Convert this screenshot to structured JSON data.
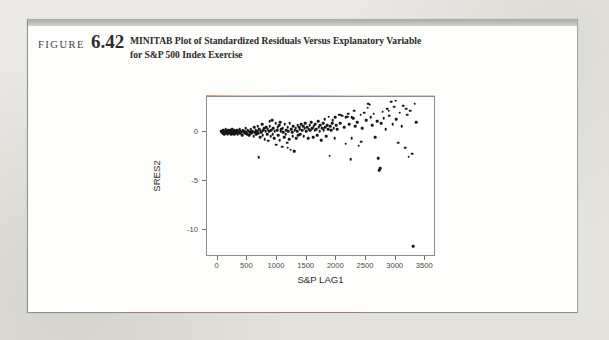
{
  "figure": {
    "label_word": "FIGURE",
    "number": "6.42",
    "caption_line1": "MINITAB Plot of Standardized Residuals Versus Explanatory Variable",
    "caption_line2": "for S&P 500 Index Exercise"
  },
  "colors": {
    "page_background": "#e9e8e4",
    "figure_background": "#fdfdfc",
    "header_bar": "#bdbdb9",
    "point_color": "#17171a",
    "axis_color": "#8c8c8a",
    "text_color": "#2b2a28"
  },
  "chart_data": {
    "type": "scatter",
    "title": "",
    "xlabel": "S&P LAG1",
    "ylabel": "SRES2",
    "xlim": [
      -180,
      3680
    ],
    "ylim": [
      -12.8,
      3.6
    ],
    "grid": false,
    "legend": "none",
    "xticks": [
      0,
      500,
      1000,
      1500,
      2000,
      2500,
      3000,
      3500
    ],
    "xtick_labels": [
      "0",
      "500",
      "1000",
      "1500",
      "2000",
      "2500",
      "3000",
      "3500"
    ],
    "yticks": [
      0,
      -5,
      -10
    ],
    "ytick_labels": [
      "0",
      "-5",
      "-10"
    ],
    "point_count": 232,
    "notable_outlier": {
      "x": 3300,
      "y": -11.7
    },
    "points": [
      [
        60,
        0.1
      ],
      [
        75,
        0.0
      ],
      [
        88,
        -0.1
      ],
      [
        96,
        0.2
      ],
      [
        104,
        0.0
      ],
      [
        112,
        -0.2
      ],
      [
        120,
        0.1
      ],
      [
        128,
        0.0
      ],
      [
        136,
        0.3
      ],
      [
        144,
        -0.1
      ],
      [
        152,
        0.1
      ],
      [
        160,
        0.0
      ],
      [
        168,
        -0.2
      ],
      [
        176,
        0.2
      ],
      [
        184,
        0.0
      ],
      [
        192,
        0.1
      ],
      [
        200,
        -0.1
      ],
      [
        208,
        0.0
      ],
      [
        216,
        0.2
      ],
      [
        224,
        -0.2
      ],
      [
        232,
        0.1
      ],
      [
        240,
        0.0
      ],
      [
        248,
        0.3
      ],
      [
        256,
        -0.1
      ],
      [
        264,
        0.0
      ],
      [
        272,
        0.1
      ],
      [
        280,
        -0.2
      ],
      [
        288,
        0.2
      ],
      [
        296,
        0.0
      ],
      [
        304,
        0.1
      ],
      [
        312,
        -0.1
      ],
      [
        320,
        0.0
      ],
      [
        330,
        0.2
      ],
      [
        340,
        -0.2
      ],
      [
        350,
        0.1
      ],
      [
        360,
        0.0
      ],
      [
        370,
        0.3
      ],
      [
        380,
        -0.1
      ],
      [
        390,
        0.1
      ],
      [
        400,
        0.0
      ],
      [
        412,
        -0.3
      ],
      [
        424,
        0.2
      ],
      [
        436,
        0.0
      ],
      [
        448,
        0.1
      ],
      [
        460,
        -0.1
      ],
      [
        472,
        0.4
      ],
      [
        484,
        0.0
      ],
      [
        496,
        -0.2
      ],
      [
        508,
        0.2
      ],
      [
        520,
        0.1
      ],
      [
        532,
        -0.3
      ],
      [
        544,
        0.0
      ],
      [
        556,
        0.3
      ],
      [
        568,
        -0.1
      ],
      [
        580,
        0.1
      ],
      [
        592,
        0.0
      ],
      [
        604,
        -0.4
      ],
      [
        616,
        0.5
      ],
      [
        628,
        0.0
      ],
      [
        640,
        0.2
      ],
      [
        652,
        -0.2
      ],
      [
        664,
        0.1
      ],
      [
        676,
        0.6
      ],
      [
        688,
        -0.1
      ],
      [
        700,
        0.3
      ],
      [
        712,
        -0.5
      ],
      [
        724,
        0.1
      ],
      [
        736,
        0.0
      ],
      [
        748,
        0.8
      ],
      [
        760,
        -0.3
      ],
      [
        772,
        0.2
      ],
      [
        784,
        0.4
      ],
      [
        690,
        -2.6
      ],
      [
        796,
        -0.7
      ],
      [
        808,
        0.1
      ],
      [
        820,
        0.5
      ],
      [
        832,
        -0.2
      ],
      [
        844,
        0.3
      ],
      [
        856,
        -0.9
      ],
      [
        868,
        0.1
      ],
      [
        880,
        0.6
      ],
      [
        892,
        -0.4
      ],
      [
        904,
        0.2
      ],
      [
        916,
        1.2
      ],
      [
        928,
        -0.2
      ],
      [
        940,
        0.4
      ],
      [
        952,
        -0.6
      ],
      [
        964,
        0.1
      ],
      [
        976,
        0.9
      ],
      [
        988,
        -1.3
      ],
      [
        1000,
        0.2
      ],
      [
        1012,
        0.5
      ],
      [
        1024,
        -0.3
      ],
      [
        1036,
        0.7
      ],
      [
        1048,
        -0.8
      ],
      [
        1060,
        0.1
      ],
      [
        1072,
        0.3
      ],
      [
        1084,
        -1.5
      ],
      [
        1096,
        0.4
      ],
      [
        1108,
        0.0
      ],
      [
        1120,
        -0.5
      ],
      [
        1132,
        0.8
      ],
      [
        1144,
        -0.2
      ],
      [
        1156,
        0.2
      ],
      [
        1168,
        -1.1
      ],
      [
        1180,
        0.5
      ],
      [
        1192,
        0.1
      ],
      [
        1204,
        -0.7
      ],
      [
        1216,
        0.9
      ],
      [
        1228,
        -1.8
      ],
      [
        1240,
        0.3
      ],
      [
        1252,
        0.0
      ],
      [
        1264,
        -0.4
      ],
      [
        1276,
        0.6
      ],
      [
        1288,
        -1.9
      ],
      [
        1300,
        0.2
      ],
      [
        1312,
        0.4
      ],
      [
        1324,
        -0.6
      ],
      [
        1336,
        0.1
      ],
      [
        1348,
        0.7
      ],
      [
        1360,
        -0.3
      ],
      [
        1372,
        0.5
      ],
      [
        1384,
        0.3
      ],
      [
        1396,
        -0.2
      ],
      [
        1410,
        0.8
      ],
      [
        1424,
        0.2
      ],
      [
        1438,
        0.6
      ],
      [
        1452,
        -0.4
      ],
      [
        1466,
        0.4
      ],
      [
        1480,
        0.9
      ],
      [
        1494,
        0.1
      ],
      [
        1508,
        0.5
      ],
      [
        1522,
        -0.6
      ],
      [
        1536,
        0.3
      ],
      [
        1550,
        0.7
      ],
      [
        1564,
        0.2
      ],
      [
        1578,
        1.0
      ],
      [
        1592,
        0.4
      ],
      [
        1606,
        -0.5
      ],
      [
        1620,
        0.6
      ],
      [
        1634,
        0.2
      ],
      [
        1648,
        0.8
      ],
      [
        1662,
        0.3
      ],
      [
        1676,
        -0.3
      ],
      [
        1690,
        1.1
      ],
      [
        1704,
        0.5
      ],
      [
        1718,
        0.1
      ],
      [
        1732,
        0.7
      ],
      [
        1746,
        -0.8
      ],
      [
        1760,
        0.4
      ],
      [
        1774,
        0.9
      ],
      [
        1788,
        0.2
      ],
      [
        1802,
        1.3
      ],
      [
        1816,
        0.5
      ],
      [
        1830,
        -0.4
      ],
      [
        1844,
        0.7
      ],
      [
        1858,
        0.3
      ],
      [
        1872,
        1.6
      ],
      [
        1886,
        -2.4
      ],
      [
        1900,
        0.6
      ],
      [
        1914,
        0.2
      ],
      [
        1928,
        0.9
      ],
      [
        1942,
        1.2
      ],
      [
        1956,
        0.4
      ],
      [
        1970,
        -0.6
      ],
      [
        1984,
        1.5
      ],
      [
        1998,
        0.7
      ],
      [
        2012,
        0.3
      ],
      [
        2040,
        1.8
      ],
      [
        2070,
        0.9
      ],
      [
        2100,
        1.7
      ],
      [
        2130,
        0.5
      ],
      [
        2160,
        -1.2
      ],
      [
        2185,
        1.6
      ],
      [
        2200,
        1.9
      ],
      [
        2215,
        0.8
      ],
      [
        2240,
        -2.8
      ],
      [
        2260,
        -0.6
      ],
      [
        2280,
        1.4
      ],
      [
        2300,
        2.2
      ],
      [
        2320,
        0.6
      ],
      [
        2350,
        1.0
      ],
      [
        2380,
        -1.4
      ],
      [
        2410,
        1.8
      ],
      [
        2440,
        0.4
      ],
      [
        2470,
        2.0
      ],
      [
        2500,
        1.2
      ],
      [
        2530,
        2.5
      ],
      [
        2560,
        2.8
      ],
      [
        2580,
        1.5
      ],
      [
        2600,
        0.7
      ],
      [
        2630,
        1.9
      ],
      [
        2660,
        -0.5
      ],
      [
        2690,
        1.1
      ],
      [
        2710,
        -2.7
      ],
      [
        2725,
        -3.9
      ],
      [
        2740,
        -3.7
      ],
      [
        2755,
        0.9
      ],
      [
        2780,
        2.1
      ],
      [
        2800,
        1.4
      ],
      [
        2830,
        0.3
      ],
      [
        2860,
        2.4
      ],
      [
        2890,
        1.7
      ],
      [
        2920,
        3.1
      ],
      [
        2950,
        0.8
      ],
      [
        2980,
        2.6
      ],
      [
        3010,
        1.3
      ],
      [
        3040,
        -1.1
      ],
      [
        3070,
        2.0
      ],
      [
        3100,
        0.6
      ],
      [
        3130,
        2.7
      ],
      [
        3160,
        -1.6
      ],
      [
        3190,
        1.8
      ],
      [
        3220,
        -2.5
      ],
      [
        3250,
        2.2
      ],
      [
        3280,
        -2.2
      ],
      [
        3300,
        -11.7
      ],
      [
        3320,
        2.9
      ],
      [
        3350,
        1.0
      ],
      [
        2540,
        2.9
      ],
      [
        2070,
        1.8
      ],
      [
        1050,
        1.0
      ],
      [
        880,
        1.1
      ],
      [
        2260,
        1.5
      ],
      [
        3000,
        3.2
      ],
      [
        2880,
        2.2
      ],
      [
        3180,
        2.4
      ],
      [
        2420,
        -1.0
      ],
      [
        1180,
        -1.6
      ],
      [
        1290,
        -2.0
      ],
      [
        2155,
        1.5
      ],
      [
        2190,
        1.6
      ]
    ]
  }
}
